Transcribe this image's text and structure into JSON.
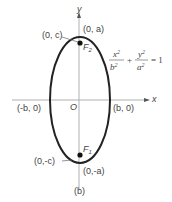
{
  "figure": {
    "caption": "(b)",
    "axes": {
      "x_label": "x",
      "y_label": "y",
      "origin_label": "O"
    },
    "points": {
      "top_vertex": "(0, a)",
      "bottom_vertex": "(0,-a)",
      "focus_upper_coord": "(0, c)",
      "focus_lower_coord": "(0,-c)",
      "left_covertex": "(-b, 0)",
      "right_covertex": "(b, 0)",
      "focus_upper_name": "F",
      "focus_upper_sub": "2",
      "focus_lower_name": "F",
      "focus_lower_sub": "1"
    },
    "equation": {
      "term1_num": "x",
      "term1_num_exp": "2",
      "term1_den": "b",
      "term1_den_exp": "2",
      "plus": "+",
      "term2_num": "y",
      "term2_num_exp": "2",
      "term2_den": "a",
      "term2_den_exp": "2",
      "rhs": "= 1"
    },
    "colors": {
      "axis": "#b0b0b0",
      "ellipse": "#222222",
      "text": "#444444"
    }
  }
}
